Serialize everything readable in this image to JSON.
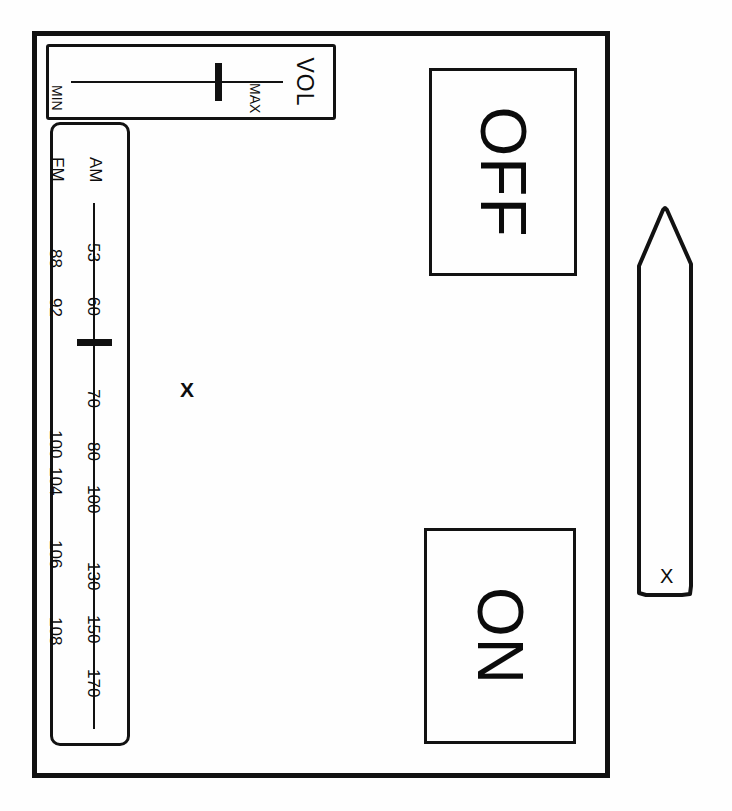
{
  "device": {
    "name": "radio-control-panel",
    "frame_color": "#111111",
    "background_color": "#fefefe"
  },
  "volume": {
    "title": "VOL",
    "min_label": "MIN",
    "max_label": "MAX",
    "value_position_percent": 72
  },
  "tuner": {
    "bands": [
      {
        "name": "AM",
        "ticks": [
          "53",
          "60",
          "70",
          "80",
          "100",
          "130",
          "150",
          "170"
        ]
      },
      {
        "name": "FM",
        "ticks": [
          "88",
          "92",
          "100",
          "104",
          "106",
          "108"
        ]
      }
    ],
    "am": {
      "label": "AM",
      "ticks": [
        {
          "text": "53",
          "top": 118
        },
        {
          "text": "60",
          "top": 172
        },
        {
          "text": "70",
          "top": 264
        },
        {
          "text": "80",
          "top": 317
        },
        {
          "text": "100",
          "top": 360
        },
        {
          "text": "130",
          "top": 437
        },
        {
          "text": "150",
          "top": 490
        },
        {
          "text": "170",
          "top": 544
        }
      ]
    },
    "fm": {
      "label": "FM",
      "ticks": [
        {
          "text": "88",
          "top": 124
        },
        {
          "text": "92",
          "top": 173
        },
        {
          "text": "100",
          "top": 305
        },
        {
          "text": "104",
          "top": 342
        },
        {
          "text": "106",
          "top": 415
        },
        {
          "text": "108",
          "top": 492
        }
      ]
    },
    "needle_position_top": 214
  },
  "buttons": {
    "off": {
      "label": "OFF"
    },
    "on": {
      "label": "ON"
    }
  },
  "pointer": {
    "label": "X"
  },
  "marks": {
    "center_x": "X"
  }
}
